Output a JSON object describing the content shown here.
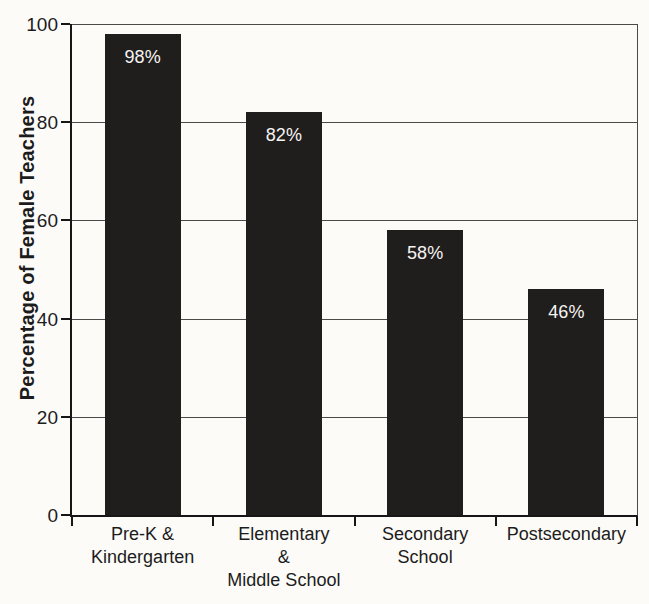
{
  "chart_data": {
    "type": "bar",
    "title": "",
    "xlabel": "",
    "ylabel": "Percentage of Female Teachers",
    "categories": [
      "Pre-K &\nKindergarten",
      "Elementary\n&\nMiddle School",
      "Secondary\nSchool",
      "Postsecondary"
    ],
    "values": [
      98,
      82,
      58,
      46
    ],
    "bar_labels": [
      "98%",
      "82%",
      "58%",
      "46%"
    ],
    "yticks": [
      0,
      20,
      40,
      60,
      80,
      100
    ],
    "ylim": [
      0,
      100
    ],
    "grid": "horizontal-only",
    "legend_position": "none",
    "colors": {
      "background": "#fcfbf8",
      "bar": "#201d1d",
      "bar_label": "#f5f4f2",
      "axis": "#161616",
      "gridline": "#4a4a4a",
      "text": "#1c1c1c"
    }
  }
}
